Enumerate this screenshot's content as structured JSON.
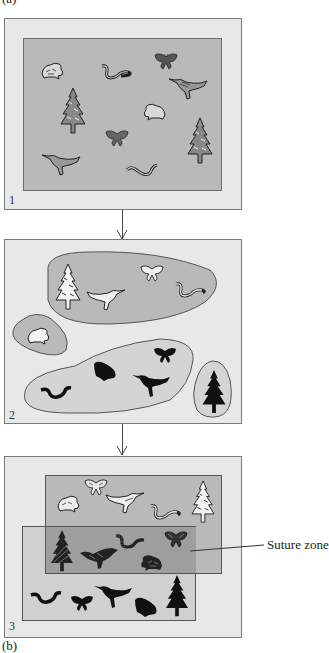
{
  "figure": {
    "top_label": "(a)",
    "bottom_label": "(b)",
    "colors": {
      "outer_bg": "#e8e8e8",
      "range_dark": "#b9b9b9",
      "range_light": "#d2d2d2",
      "overlap": "#9e9e9e",
      "ink": "#222222"
    }
  },
  "panels": [
    {
      "number": "1",
      "description": "Single continuous ancestral population",
      "organisms": [
        "frog",
        "snake",
        "butterfly",
        "bird",
        "tree",
        "frog",
        "butterfly",
        "tree",
        "bird",
        "snake"
      ]
    },
    {
      "number": "2",
      "description": "Population separated into isolated ranges",
      "regions": [
        {
          "name": "northern-range",
          "organisms": [
            "tree",
            "bird",
            "butterfly",
            "snake"
          ],
          "style": "outlined"
        },
        {
          "name": "frog-refuge",
          "organisms": [
            "frog"
          ],
          "style": "outlined"
        },
        {
          "name": "southern-range",
          "organisms": [
            "frog",
            "butterfly",
            "snake",
            "bird"
          ],
          "style": "silhouette"
        },
        {
          "name": "tree-refuge",
          "organisms": [
            "tree"
          ],
          "style": "silhouette"
        }
      ]
    },
    {
      "number": "3",
      "description": "Ranges re-expand and overlap",
      "regions": [
        {
          "name": "northern-range",
          "organisms": [
            "frog",
            "butterfly",
            "bird",
            "snake",
            "tree"
          ],
          "style": "outlined"
        },
        {
          "name": "overlap",
          "organisms": [
            "tree",
            "bird",
            "snake",
            "butterfly",
            "frog"
          ],
          "style": "hatched"
        },
        {
          "name": "southern-range",
          "organisms": [
            "snake",
            "butterfly",
            "bird",
            "frog",
            "tree"
          ],
          "style": "silhouette"
        }
      ],
      "callout": "Suture zone"
    }
  ]
}
